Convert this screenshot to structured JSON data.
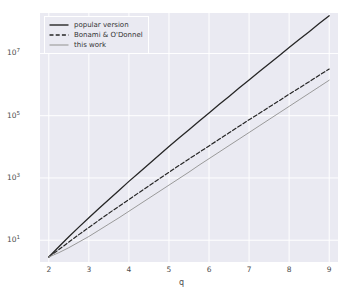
{
  "chart_data": {
    "type": "line",
    "title": "",
    "xlabel": "q",
    "ylabel": "",
    "xlim": [
      1.78,
      9.22
    ],
    "ylim_log10": [
      0.3,
      8.3
    ],
    "yscale": "log",
    "xscale": "linear",
    "grid": true,
    "grid_color": "#ffffff",
    "axes_bg": "#eaeaf2",
    "figure_bg": "#ffffff",
    "legend_position": "upper left",
    "xticks": [
      2,
      3,
      4,
      5,
      6,
      7,
      8,
      9
    ],
    "xticklabels": [
      "2",
      "3",
      "4",
      "5",
      "6",
      "7",
      "8",
      "9"
    ],
    "yticks_log10": [
      1,
      3,
      5,
      7
    ],
    "yticklabels": [
      "10",
      "10",
      "10",
      "10"
    ],
    "yticklabel_exponents": [
      "1",
      "3",
      "5",
      "7"
    ],
    "x": [
      2.0,
      2.25,
      2.5,
      2.75,
      3.0,
      3.25,
      3.5,
      3.75,
      4.0,
      4.25,
      4.5,
      4.75,
      5.0,
      5.25,
      5.5,
      5.75,
      6.0,
      6.25,
      6.5,
      6.75,
      7.0,
      7.25,
      7.5,
      7.75,
      8.0,
      8.25,
      8.5,
      8.75,
      9.0
    ],
    "series": [
      {
        "name": "popular version",
        "color": "#262626",
        "linestyle": "solid",
        "linewidth": 1.3,
        "values_log10": [
          0.46,
          0.79,
          1.11,
          1.42,
          1.72,
          2.02,
          2.31,
          2.6,
          2.89,
          3.17,
          3.45,
          3.73,
          4.01,
          4.28,
          4.55,
          4.82,
          5.09,
          5.36,
          5.62,
          5.89,
          6.15,
          6.41,
          6.67,
          6.93,
          7.19,
          7.45,
          7.7,
          7.96,
          8.21
        ]
      },
      {
        "name": "Bonami & O'Donnel",
        "color": "#262626",
        "linestyle": "dashed",
        "linewidth": 1.2,
        "values_log10": [
          0.46,
          0.7,
          0.94,
          1.18,
          1.41,
          1.64,
          1.87,
          2.09,
          2.31,
          2.53,
          2.75,
          2.97,
          3.18,
          3.4,
          3.61,
          3.82,
          4.03,
          4.24,
          4.45,
          4.66,
          4.87,
          5.07,
          5.28,
          5.48,
          5.69,
          5.89,
          6.09,
          6.3,
          6.5
        ]
      },
      {
        "name": "this work",
        "color": "#9a9a9a",
        "linestyle": "solid",
        "linewidth": 1.0,
        "values_log10": [
          0.46,
          0.6,
          0.76,
          0.94,
          1.12,
          1.32,
          1.52,
          1.72,
          1.93,
          2.14,
          2.35,
          2.56,
          2.77,
          2.98,
          3.19,
          3.41,
          3.62,
          3.83,
          4.04,
          4.25,
          4.46,
          4.67,
          4.88,
          5.09,
          5.3,
          5.51,
          5.72,
          5.93,
          6.14
        ]
      }
    ],
    "legend_entries": [
      {
        "label": "popular version",
        "color": "#262626",
        "linestyle": "solid"
      },
      {
        "label": "Bonami & O'Donnel",
        "color": "#262626",
        "linestyle": "dashed"
      },
      {
        "label": "this work",
        "color": "#9a9a9a",
        "linestyle": "solid"
      }
    ]
  }
}
